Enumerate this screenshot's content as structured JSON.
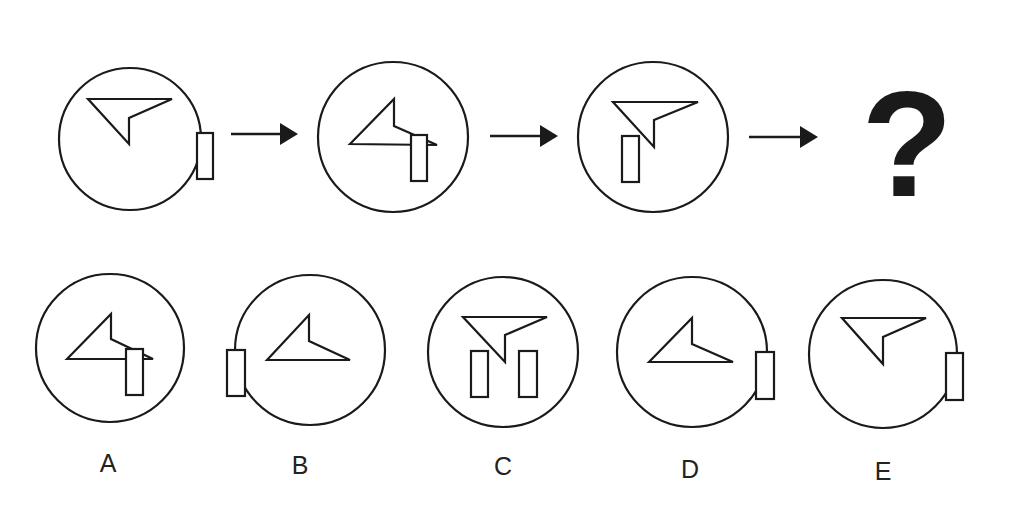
{
  "puzzle": {
    "question_mark": "?",
    "stroke_color": "#1a1a1a",
    "background_color": "#ffffff",
    "sequence": [
      {
        "id": "step-1",
        "circle": {
          "cx": 130,
          "cy": 139,
          "r": 71
        },
        "arrowhead": [
          [
            88,
            99
          ],
          [
            172,
            99
          ],
          [
            129,
            118
          ],
          [
            129,
            144
          ]
        ],
        "rects": [
          {
            "x": 197,
            "y": 133,
            "w": 16,
            "h": 46
          }
        ]
      },
      {
        "id": "step-2",
        "circle": {
          "cx": 393,
          "cy": 137,
          "r": 75
        },
        "arrowhead": [
          [
            350,
            144
          ],
          [
            394,
            99
          ],
          [
            394,
            126
          ],
          [
            437,
            145
          ]
        ],
        "rects": [
          {
            "x": 411,
            "y": 135,
            "w": 16,
            "h": 46
          }
        ]
      },
      {
        "id": "step-3",
        "circle": {
          "cx": 653,
          "cy": 137,
          "r": 75
        },
        "arrowhead": [
          [
            613,
            102
          ],
          [
            698,
            102
          ],
          [
            654,
            120
          ],
          [
            654,
            147
          ]
        ],
        "rects": [
          {
            "x": 622,
            "y": 136,
            "w": 17,
            "h": 46
          }
        ]
      }
    ],
    "flow_arrows": [
      {
        "x1": 231,
        "x2": 298,
        "y": 134
      },
      {
        "x1": 490,
        "x2": 558,
        "y": 136
      },
      {
        "x1": 749,
        "x2": 818,
        "y": 137
      }
    ],
    "options": [
      {
        "label": "A",
        "label_pos": {
          "x": 108,
          "y": 472
        },
        "circle": {
          "cx": 110,
          "cy": 348,
          "r": 74
        },
        "arrowhead": [
          [
            67,
            359
          ],
          [
            111,
            314
          ],
          [
            111,
            339
          ],
          [
            153,
            359
          ]
        ],
        "rects": [
          {
            "x": 126,
            "y": 349,
            "w": 17,
            "h": 46
          }
        ]
      },
      {
        "label": "B",
        "label_pos": {
          "x": 300,
          "y": 474
        },
        "circle": {
          "cx": 310,
          "cy": 350,
          "r": 75
        },
        "arrowhead": [
          [
            267,
            360
          ],
          [
            309,
            315
          ],
          [
            309,
            341
          ],
          [
            350,
            360
          ]
        ],
        "rects": [
          {
            "x": 227,
            "y": 350,
            "w": 18,
            "h": 46
          }
        ]
      },
      {
        "label": "C",
        "label_pos": {
          "x": 503,
          "y": 475
        },
        "circle": {
          "cx": 503,
          "cy": 352,
          "r": 75
        },
        "arrowhead": [
          [
            463,
            317
          ],
          [
            547,
            317
          ],
          [
            505,
            335
          ],
          [
            505,
            362
          ]
        ],
        "rects": [
          {
            "x": 471,
            "y": 351,
            "w": 17,
            "h": 46
          },
          {
            "x": 519,
            "y": 351,
            "w": 18,
            "h": 46
          }
        ]
      },
      {
        "label": "D",
        "label_pos": {
          "x": 690,
          "y": 478
        },
        "circle": {
          "cx": 692,
          "cy": 352,
          "r": 75
        },
        "arrowhead": [
          [
            649,
            362
          ],
          [
            692,
            318
          ],
          [
            692,
            344
          ],
          [
            733,
            362
          ]
        ],
        "rects": [
          {
            "x": 756,
            "y": 352,
            "w": 18,
            "h": 47
          }
        ]
      },
      {
        "label": "E",
        "label_pos": {
          "x": 883,
          "y": 480
        },
        "circle": {
          "cx": 883,
          "cy": 354,
          "r": 74
        },
        "arrowhead": [
          [
            842,
            318
          ],
          [
            926,
            318
          ],
          [
            883,
            337
          ],
          [
            883,
            364
          ]
        ],
        "rects": [
          {
            "x": 946,
            "y": 353,
            "w": 17,
            "h": 47
          }
        ]
      }
    ]
  }
}
